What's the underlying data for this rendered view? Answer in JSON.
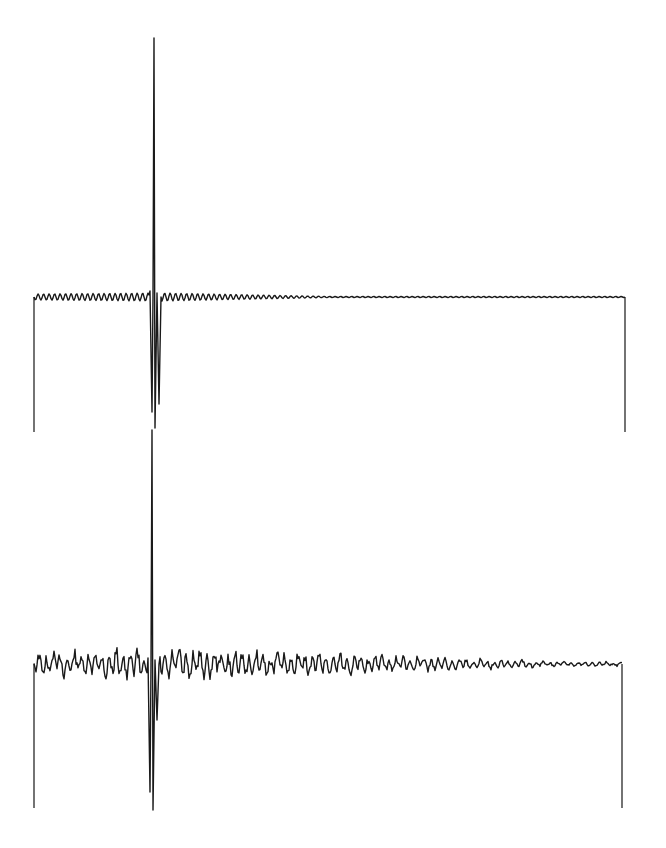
{
  "header": {
    "text": ""
  },
  "chart_data": [
    {
      "type": "line",
      "title": "",
      "xlabel": "",
      "ylabel": "",
      "description": "Top trace: sharp central impulse with small, regular damped oscillation decaying to flat toward the right",
      "grid": false,
      "legend": null,
      "frame_px": {
        "left_x": 34,
        "right_x": 625,
        "baseline_y": 297,
        "bottom_y": 432
      },
      "impulse_px": {
        "x": 154,
        "peak_y": 38,
        "neg_peaks_y": [
          428,
          412,
          404
        ]
      },
      "ripple": {
        "amplitude_px_left": 4,
        "amplitude_px_right": 0.5,
        "period_px": 5.5,
        "decay_start_x": 165,
        "flat_after_x": 330
      }
    },
    {
      "type": "line",
      "title": "",
      "xlabel": "",
      "ylabel": "",
      "description": "Bottom trace: central impulse with larger, irregular noisy oscillation decaying slowly toward the right",
      "grid": false,
      "legend": null,
      "frame_px": {
        "left_x": 34,
        "right_x": 622,
        "baseline_y": 664,
        "bottom_y": 808
      },
      "impulse_px": {
        "x": 152,
        "peak_y": 430,
        "neg_peaks_y": [
          810,
          792,
          720
        ]
      },
      "ripple": {
        "amplitude_px_left": 10,
        "amplitude_px_right": 1.5,
        "period_px": 7,
        "decay_start_x": 170,
        "flat_after_x": 560
      }
    }
  ]
}
